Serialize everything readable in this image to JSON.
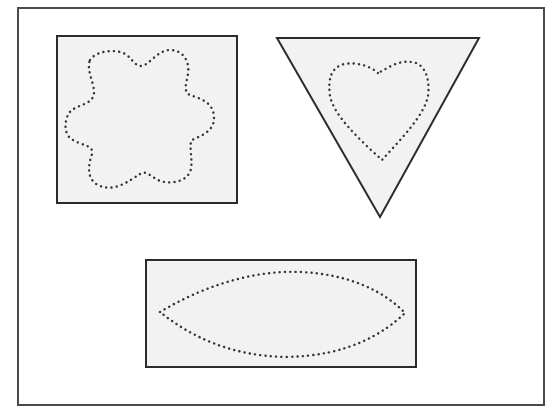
{
  "diagram": {
    "colors": {
      "background": "#ffffff",
      "frame_stroke": "#4a4a4a",
      "shape_fill": "#f2f2f2",
      "shape_stroke": "#2b2b2b",
      "dots": "#333333"
    },
    "shapes": [
      {
        "outer": "square",
        "inner": "flower (6 petals, dotted)"
      },
      {
        "outer": "inverted triangle",
        "inner": "heart (dotted)"
      },
      {
        "outer": "rectangle",
        "inner": "lens / leaf (dotted)"
      }
    ]
  }
}
